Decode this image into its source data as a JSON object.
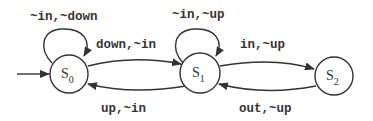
{
  "diagram": {
    "type": "state-machine",
    "initial_state": "S0",
    "states": [
      {
        "id": "S0",
        "label": "S",
        "sub": "0"
      },
      {
        "id": "S1",
        "label": "S",
        "sub": "1"
      },
      {
        "id": "S2",
        "label": "S",
        "sub": "2"
      }
    ],
    "transitions": [
      {
        "from": "S0",
        "to": "S0",
        "label": "~in,~down"
      },
      {
        "from": "S0",
        "to": "S1",
        "label": "down,~in"
      },
      {
        "from": "S1",
        "to": "S0",
        "label": "up,~in"
      },
      {
        "from": "S1",
        "to": "S1",
        "label": "~in,~up"
      },
      {
        "from": "S1",
        "to": "S2",
        "label": "in,~up"
      },
      {
        "from": "S2",
        "to": "S1",
        "label": "out,~up"
      }
    ]
  },
  "colors": {
    "stroke": "#333333",
    "background": "#ffffff"
  }
}
